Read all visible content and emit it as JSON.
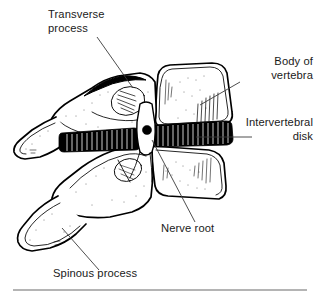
{
  "figure": {
    "type": "anatomical-line-drawing",
    "background_color": "#ffffff",
    "ink_color": "#000000",
    "label_color": "#1a1a1a",
    "leader_color": "#3a3a3a",
    "rule_color": "#9b9b9b"
  },
  "labels": {
    "transverse_process": {
      "line1": "Transverse",
      "line2": "process",
      "align": "start",
      "x": 48,
      "y1": 18,
      "y2": 32,
      "leader": "M97,37 L133,88"
    },
    "body_of_vertebra": {
      "line1": "Body of",
      "line2": "vertebra",
      "align": "end",
      "x": 313,
      "y1": 65,
      "y2": 79,
      "leader": "M240,82 L200,105"
    },
    "intervertebral_disk": {
      "line1": "Intervertebral",
      "line2": "disk",
      "align": "end",
      "x": 313,
      "y1": 126,
      "y2": 140,
      "leader": "M252,137 L196,137"
    },
    "nerve_root": {
      "line1": "Nerve root",
      "align": "start",
      "x": 161,
      "y1": 232,
      "leader": "M152,140 L195,222"
    },
    "spinous_process": {
      "line1": "Spinous process",
      "align": "start",
      "x": 53,
      "y1": 277,
      "leader": "M62,228 L99,270"
    }
  },
  "structures": {
    "upper_vertebral_body": "rounded-rectangular block, upper right",
    "lower_vertebral_body": "rounded-rectangular block, lower right",
    "intervertebral_disk_band": "dark band with white vertical striations between bodies",
    "nerve_root_marker": "solid black circle in pedicle channel",
    "transverse_process_facet": "hatched oval facet upper left of arch",
    "spinous_processes": "two elongated tapering processes to lower left"
  },
  "bottom_rule": {
    "x1": 13,
    "x2": 307,
    "y": 290
  }
}
